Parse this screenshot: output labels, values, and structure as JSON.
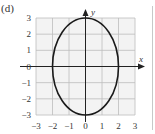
{
  "panel_label": "(d)",
  "chart_data": {
    "type": "line",
    "title": "",
    "panel": "(d)",
    "xlabel": "x",
    "ylabel": "y",
    "xlim": [
      -3,
      3
    ],
    "ylim": [
      -3,
      3
    ],
    "grid": true,
    "x_ticks": [
      "-3",
      "-2",
      "-1",
      "0",
      "1",
      "2",
      "3"
    ],
    "y_ticks": [
      "3",
      "2",
      "1",
      "0",
      "-1",
      "-2",
      "-3"
    ],
    "series": [
      {
        "name": "ellipse",
        "shape": "ellipse",
        "center": [
          0,
          0
        ],
        "semi_axis_x": 2,
        "semi_axis_y": 3,
        "equation": "x^2/4 + y^2/9 = 1",
        "color": "#1a1a1a"
      }
    ],
    "legend": null
  },
  "colors": {
    "grid": "#bdbdbd",
    "grid_fill": "#f3f3f3",
    "axis": "#222222",
    "curve": "#1a1a1a"
  }
}
